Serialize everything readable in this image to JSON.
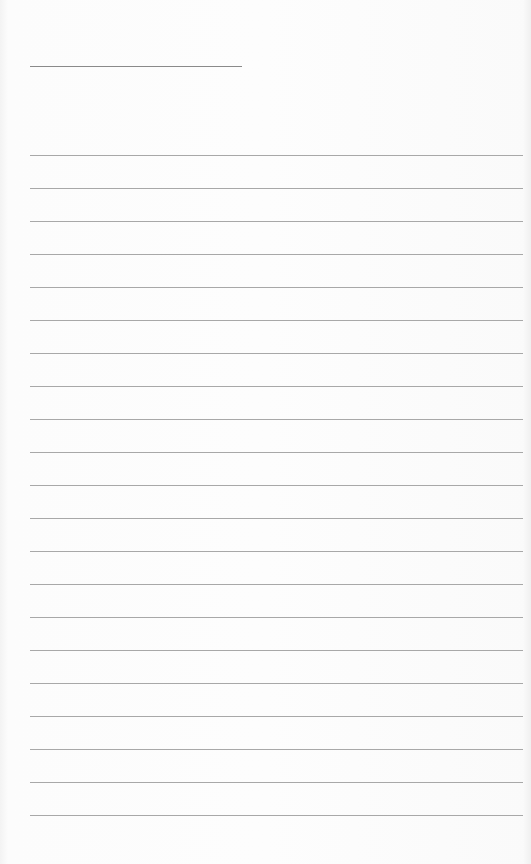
{
  "page": {
    "type": "lined-paper",
    "background_color": "#fbfbfb",
    "line_color": "#a8a8a8",
    "header_line": {
      "x": 30,
      "y": 66,
      "width": 212
    },
    "rules": {
      "count": 21,
      "first_y": 155,
      "spacing": 33,
      "x": 30,
      "width": 493
    }
  }
}
